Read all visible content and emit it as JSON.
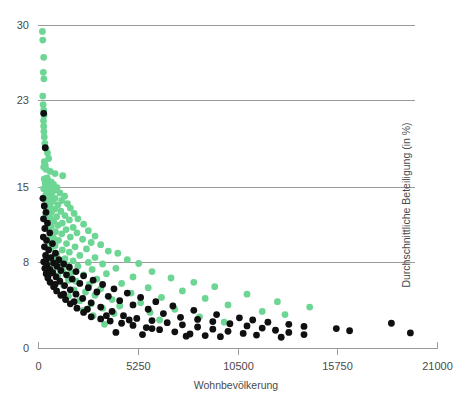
{
  "chart_data": {
    "type": "scatter",
    "title": "",
    "xlabel": "Wohnbevölkerung",
    "ylabel": "Durchschnittliche Beteiligung (in %)",
    "xlim": [
      0,
      21000
    ],
    "ylim": [
      0,
      30
    ],
    "xticks": [
      0,
      5250,
      10500,
      15750,
      21000
    ],
    "xtick_labels": [
      "0",
      "5250",
      "10500",
      "15750",
      "21000"
    ],
    "yticks": [
      0,
      8,
      15,
      23,
      30
    ],
    "ytick_labels": [
      "0",
      "8",
      "15",
      "23",
      "30"
    ],
    "grid": "horizontal",
    "grid_values": [
      8,
      15,
      23,
      30
    ],
    "legend": "none",
    "colors": {
      "series_green": "#6ed695",
      "series_black": "#101010",
      "axis": "#9a9a9a",
      "text": "#4a4a4a",
      "background": "#ffffff"
    },
    "marker_radius_px": 3.4,
    "series": [
      {
        "name": "green",
        "color": "#6ed695",
        "points": [
          [
            230,
            29.4
          ],
          [
            250,
            28.6
          ],
          [
            300,
            27.0
          ],
          [
            280,
            25.6
          ],
          [
            310,
            25.0
          ],
          [
            250,
            23.4
          ],
          [
            270,
            22.6
          ],
          [
            300,
            22.1
          ],
          [
            320,
            21.6
          ],
          [
            290,
            21.1
          ],
          [
            300,
            20.6
          ],
          [
            310,
            20.1
          ],
          [
            330,
            19.6
          ],
          [
            360,
            19.0
          ],
          [
            430,
            18.5
          ],
          [
            500,
            18.1
          ],
          [
            560,
            17.6
          ],
          [
            330,
            17.3
          ],
          [
            380,
            17.0
          ],
          [
            300,
            16.8
          ],
          [
            420,
            16.6
          ],
          [
            640,
            16.4
          ],
          [
            900,
            16.2
          ],
          [
            1300,
            16.0
          ],
          [
            480,
            15.8
          ],
          [
            330,
            15.7
          ],
          [
            560,
            15.5
          ],
          [
            700,
            15.4
          ],
          [
            380,
            15.3
          ],
          [
            820,
            15.2
          ],
          [
            430,
            15.1
          ],
          [
            640,
            15.0
          ],
          [
            1000,
            14.9
          ],
          [
            300,
            14.8
          ],
          [
            900,
            14.7
          ],
          [
            520,
            14.6
          ],
          [
            760,
            14.5
          ],
          [
            1150,
            14.4
          ],
          [
            680,
            14.3
          ],
          [
            400,
            14.2
          ],
          [
            1400,
            14.1
          ],
          [
            560,
            14.0
          ],
          [
            900,
            13.9
          ],
          [
            350,
            13.8
          ],
          [
            1250,
            13.7
          ],
          [
            760,
            13.6
          ],
          [
            480,
            13.5
          ],
          [
            1550,
            13.4
          ],
          [
            1050,
            13.3
          ],
          [
            620,
            13.2
          ],
          [
            380,
            13.1
          ],
          [
            1700,
            13.0
          ],
          [
            880,
            12.9
          ],
          [
            540,
            12.8
          ],
          [
            1200,
            12.7
          ],
          [
            700,
            12.6
          ],
          [
            1900,
            12.5
          ],
          [
            420,
            12.4
          ],
          [
            1420,
            12.3
          ],
          [
            980,
            12.2
          ],
          [
            620,
            12.1
          ],
          [
            2100,
            12.0
          ],
          [
            1650,
            11.9
          ],
          [
            820,
            11.8
          ],
          [
            480,
            11.7
          ],
          [
            1280,
            11.6
          ],
          [
            2400,
            11.5
          ],
          [
            1050,
            11.4
          ],
          [
            700,
            11.3
          ],
          [
            1850,
            11.2
          ],
          [
            560,
            11.1
          ],
          [
            1480,
            11.0
          ],
          [
            2650,
            10.9
          ],
          [
            920,
            10.8
          ],
          [
            2050,
            10.7
          ],
          [
            1250,
            10.6
          ],
          [
            640,
            10.5
          ],
          [
            3000,
            10.4
          ],
          [
            1700,
            10.3
          ],
          [
            820,
            10.2
          ],
          [
            2350,
            10.1
          ],
          [
            1080,
            10.0
          ],
          [
            520,
            9.9
          ],
          [
            2800,
            9.8
          ],
          [
            1500,
            9.7
          ],
          [
            3300,
            9.6
          ],
          [
            900,
            9.5
          ],
          [
            1950,
            9.4
          ],
          [
            700,
            9.3
          ],
          [
            2550,
            9.2
          ],
          [
            1280,
            9.1
          ],
          [
            3700,
            9.0
          ],
          [
            1650,
            8.9
          ],
          [
            4200,
            8.8
          ],
          [
            980,
            8.7
          ],
          [
            2200,
            8.6
          ],
          [
            820,
            8.5
          ],
          [
            3000,
            8.4
          ],
          [
            1420,
            8.3
          ],
          [
            4700,
            8.2
          ],
          [
            1850,
            8.1
          ],
          [
            640,
            8.0
          ],
          [
            2650,
            7.95
          ],
          [
            1100,
            7.9
          ],
          [
            5300,
            7.85
          ],
          [
            3400,
            7.8
          ],
          [
            1550,
            7.7
          ],
          [
            2100,
            7.6
          ],
          [
            900,
            7.5
          ],
          [
            4100,
            7.4
          ],
          [
            2850,
            7.3
          ],
          [
            1300,
            7.2
          ],
          [
            6000,
            7.1
          ],
          [
            1750,
            7.0
          ],
          [
            3600,
            6.9
          ],
          [
            2400,
            6.8
          ],
          [
            1050,
            6.7
          ],
          [
            5000,
            6.6
          ],
          [
            7000,
            6.5
          ],
          [
            3100,
            6.4
          ],
          [
            1600,
            6.3
          ],
          [
            2000,
            6.2
          ],
          [
            8200,
            6.1
          ],
          [
            4400,
            6.0
          ],
          [
            2700,
            5.9
          ],
          [
            1350,
            5.8
          ],
          [
            9300,
            5.7
          ],
          [
            5800,
            5.6
          ],
          [
            3300,
            5.5
          ],
          [
            1900,
            5.4
          ],
          [
            7600,
            5.3
          ],
          [
            2500,
            5.2
          ],
          [
            4900,
            5.1
          ],
          [
            11000,
            5.0
          ],
          [
            3000,
            4.9
          ],
          [
            1600,
            4.8
          ],
          [
            6500,
            4.7
          ],
          [
            8800,
            4.6
          ],
          [
            3900,
            4.5
          ],
          [
            2200,
            4.4
          ],
          [
            12600,
            4.3
          ],
          [
            5400,
            4.2
          ],
          [
            2800,
            4.1
          ],
          [
            10000,
            4.0
          ],
          [
            4300,
            3.9
          ],
          [
            14300,
            3.8
          ],
          [
            3400,
            3.7
          ],
          [
            7200,
            3.6
          ],
          [
            2400,
            3.5
          ],
          [
            11800,
            3.4
          ],
          [
            5900,
            3.3
          ],
          [
            4000,
            3.2
          ],
          [
            13000,
            3.1
          ],
          [
            2900,
            3.0
          ],
          [
            8500,
            2.9
          ],
          [
            6400,
            2.6
          ],
          [
            9800,
            2.4
          ],
          [
            3500,
            2.2
          ]
        ]
      },
      {
        "name": "black",
        "color": "#101010",
        "points": [
          [
            300,
            21.8
          ],
          [
            380,
            18.6
          ],
          [
            260,
            13.9
          ],
          [
            330,
            13.2
          ],
          [
            420,
            12.6
          ],
          [
            290,
            12.0
          ],
          [
            500,
            11.6
          ],
          [
            360,
            11.1
          ],
          [
            620,
            10.7
          ],
          [
            280,
            10.3
          ],
          [
            450,
            10.0
          ],
          [
            760,
            9.7
          ],
          [
            340,
            9.4
          ],
          [
            560,
            9.1
          ],
          [
            920,
            8.8
          ],
          [
            400,
            8.6
          ],
          [
            680,
            8.4
          ],
          [
            1100,
            8.2
          ],
          [
            300,
            8.0
          ],
          [
            820,
            7.9
          ],
          [
            1350,
            7.8
          ],
          [
            480,
            7.7
          ],
          [
            1000,
            7.6
          ],
          [
            1650,
            7.5
          ],
          [
            360,
            7.4
          ],
          [
            620,
            7.3
          ],
          [
            1200,
            7.2
          ],
          [
            2000,
            7.1
          ],
          [
            780,
            7.0
          ],
          [
            430,
            6.9
          ],
          [
            1500,
            6.8
          ],
          [
            2400,
            6.7
          ],
          [
            950,
            6.6
          ],
          [
            520,
            6.5
          ],
          [
            1800,
            6.4
          ],
          [
            2900,
            6.3
          ],
          [
            1150,
            6.2
          ],
          [
            640,
            6.1
          ],
          [
            2200,
            6.0
          ],
          [
            3400,
            5.9
          ],
          [
            1400,
            5.8
          ],
          [
            820,
            5.7
          ],
          [
            2650,
            5.6
          ],
          [
            4000,
            5.5
          ],
          [
            1700,
            5.4
          ],
          [
            980,
            5.3
          ],
          [
            3100,
            5.2
          ],
          [
            4700,
            5.1
          ],
          [
            2000,
            5.0
          ],
          [
            1200,
            4.9
          ],
          [
            3700,
            4.8
          ],
          [
            5400,
            4.7
          ],
          [
            2350,
            4.6
          ],
          [
            1450,
            4.5
          ],
          [
            4300,
            4.4
          ],
          [
            6200,
            4.3
          ],
          [
            2800,
            4.2
          ],
          [
            1700,
            4.1
          ],
          [
            5000,
            4.0
          ],
          [
            7100,
            3.9
          ],
          [
            3300,
            3.8
          ],
          [
            2050,
            3.7
          ],
          [
            5800,
            3.6
          ],
          [
            8200,
            3.5
          ],
          [
            3900,
            3.4
          ],
          [
            2400,
            3.3
          ],
          [
            6600,
            3.2
          ],
          [
            9400,
            3.1
          ],
          [
            4500,
            3.0
          ],
          [
            2800,
            2.9
          ],
          [
            7500,
            2.85
          ],
          [
            10600,
            2.8
          ],
          [
            5200,
            2.75
          ],
          [
            3300,
            2.7
          ],
          [
            8400,
            2.65
          ],
          [
            11300,
            2.6
          ],
          [
            6000,
            2.55
          ],
          [
            3800,
            2.5
          ],
          [
            9200,
            2.45
          ],
          [
            12100,
            2.4
          ],
          [
            6800,
            2.35
          ],
          [
            4400,
            2.3
          ],
          [
            10100,
            2.25
          ],
          [
            13200,
            2.2
          ],
          [
            7600,
            2.15
          ],
          [
            5000,
            2.1
          ],
          [
            11000,
            2.05
          ],
          [
            14000,
            2.0
          ],
          [
            8400,
            1.95
          ],
          [
            5700,
            1.9
          ],
          [
            11800,
            1.85
          ],
          [
            15700,
            1.8
          ],
          [
            9200,
            1.75
          ],
          [
            6400,
            1.7
          ],
          [
            12500,
            1.65
          ],
          [
            16400,
            1.6
          ],
          [
            10000,
            1.55
          ],
          [
            7200,
            1.5
          ],
          [
            13200,
            1.45
          ],
          [
            19600,
            1.4
          ],
          [
            10800,
            1.35
          ],
          [
            8000,
            1.3
          ],
          [
            14000,
            1.25
          ],
          [
            18600,
            2.3
          ],
          [
            11500,
            1.2
          ],
          [
            8800,
            1.15
          ],
          [
            6000,
            1.8
          ],
          [
            4800,
            2.6
          ],
          [
            3600,
            3.0
          ],
          [
            2600,
            3.6
          ],
          [
            1900,
            4.3
          ],
          [
            1350,
            5.0
          ],
          [
            900,
            5.9
          ],
          [
            600,
            6.9
          ],
          [
            420,
            8.1
          ],
          [
            7800,
            1.1
          ],
          [
            9600,
            1.05
          ],
          [
            12800,
            1.0
          ],
          [
            5500,
            1.25
          ],
          [
            4100,
            1.45
          ]
        ]
      }
    ]
  },
  "axes": {
    "x_axis_label": "Wohnbevölkerung",
    "y_axis_label": "Durchschnittliche Beteiligung (in %)"
  }
}
